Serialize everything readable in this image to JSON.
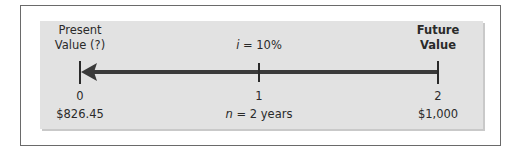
{
  "diagram": {
    "type": "time-value-of-money timeline",
    "left_label": {
      "line1": "Present",
      "line2": "Value (?)"
    },
    "right_label": {
      "line1": "Future",
      "line2": "Value"
    },
    "rate": {
      "var": "i",
      "eq": " = 10%"
    },
    "periods": [
      "0",
      "1",
      "2"
    ],
    "present_value": "$826.45",
    "future_value": "$1,000",
    "n": {
      "var": "n",
      "eq": " = 2 years"
    },
    "arrow_direction": "right-to-left",
    "colors": {
      "panel": "#e2e2e2",
      "line": "#3a3a3a",
      "frame": "#6a6a6a"
    }
  }
}
